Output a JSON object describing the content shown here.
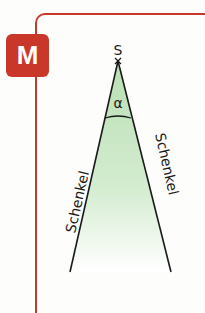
{
  "badge": {
    "label": "M",
    "color": "#c8372a"
  },
  "diagram": {
    "vertex_label": "S",
    "angle_label": "α",
    "left_side_label": "Schenkel",
    "right_side_label": "Schenkel",
    "fill_color": "#c7e6c2",
    "frame_color": "#c8372a"
  }
}
